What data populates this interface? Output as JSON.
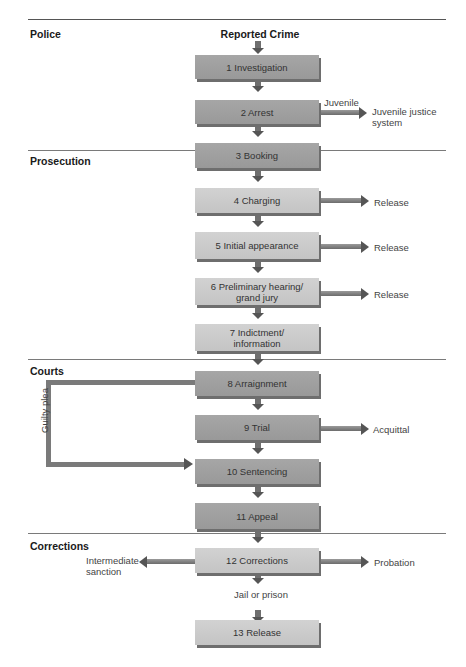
{
  "title": "Reported Crime",
  "sections": [
    {
      "label": "Police"
    },
    {
      "label": "Prosecution"
    },
    {
      "label": "Courts"
    },
    {
      "label": "Corrections"
    }
  ],
  "steps": [
    {
      "label": "1 Investigation",
      "section": "Police"
    },
    {
      "label": "2 Arrest",
      "section": "Police"
    },
    {
      "label": "3 Booking",
      "section": "Police"
    },
    {
      "label": "4 Charging",
      "section": "Prosecution"
    },
    {
      "label": "5 Initial appearance",
      "section": "Prosecution"
    },
    {
      "label": "6 Preliminary hearing/ grand jury",
      "section": "Prosecution"
    },
    {
      "label": "7 Indictment/ information",
      "section": "Prosecution"
    },
    {
      "label": "8 Arraignment",
      "section": "Courts"
    },
    {
      "label": "9 Trial",
      "section": "Courts"
    },
    {
      "label": "10 Sentencing",
      "section": "Courts"
    },
    {
      "label": "11 Appeal",
      "section": "Courts"
    },
    {
      "label": "12 Corrections",
      "section": "Corrections"
    },
    {
      "label": "13 Release",
      "section": "Corrections"
    }
  ],
  "branches": {
    "arrest_label": "Juvenile",
    "arrest_outcome": "Juvenile justice system",
    "charging_outcome": "Release",
    "initial_outcome": "Release",
    "prelim_outcome": "Release",
    "trial_outcome": "Acquittal",
    "guilty_plea": "Guilty plea",
    "corrections_left": "Intermediate sanction",
    "corrections_right": "Probation",
    "corrections_down": "Jail or prison"
  },
  "colors": {
    "dark_box": "#a0a0a0",
    "light_box": "#cacaca",
    "arrow": "#6f6f6f",
    "divider": "#7a7a7a"
  }
}
